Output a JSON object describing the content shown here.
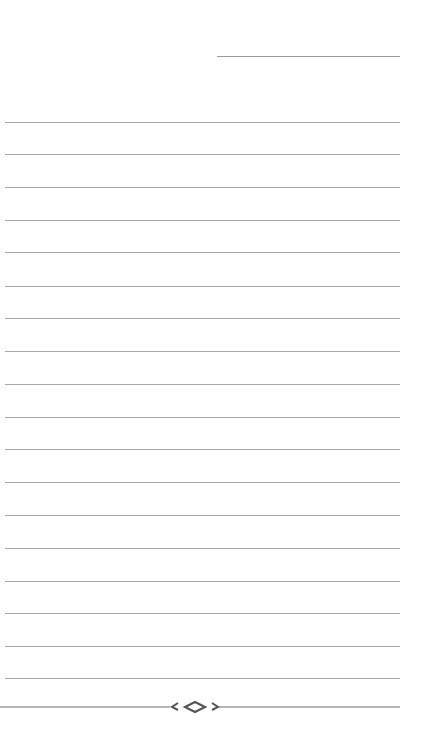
{
  "page": {
    "type": "blank-lined-page",
    "header_line": {
      "x": 217,
      "y": 56,
      "width": 183
    },
    "ruled_lines": {
      "count": 18,
      "left": 5,
      "width": 395,
      "y_positions": [
        122,
        154,
        187,
        220,
        252,
        286,
        318,
        351,
        384,
        417,
        449,
        482,
        515,
        548,
        581,
        613,
        646,
        678
      ]
    },
    "footer_ornament": {
      "icon": "diamond-flourish-icon",
      "center_x": 195,
      "y": 707,
      "line_color": "#707070"
    },
    "colors": {
      "background": "#ffffff",
      "rule": "#a8a8a8",
      "ornament": "#6a6a6a"
    }
  }
}
